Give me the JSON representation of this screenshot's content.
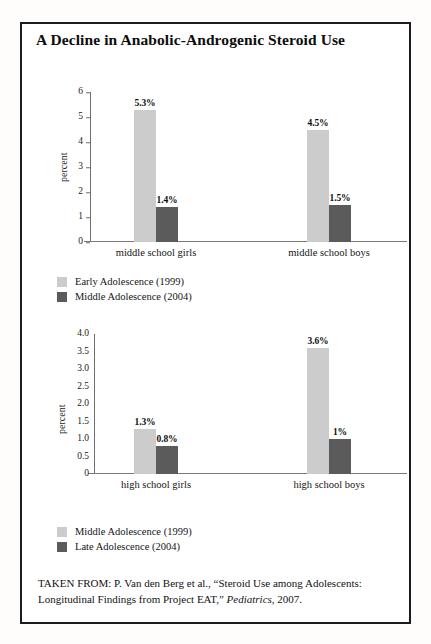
{
  "figure": {
    "title": "A Decline in Anabolic-Androgenic Steroid Use",
    "source_prefix": "TAKEN FROM: P. Van den Berg et al., “Steroid Use among Adolescents: Longitudinal Findings from Project EAT,” ",
    "source_italic": "Pediatrics",
    "source_suffix": ", 2007."
  },
  "colors": {
    "light_series": "#cccccc",
    "dark_series": "#5b5b5b",
    "frame": "#1c1c1c",
    "axis": "#6e6e6e"
  },
  "chart_data": [
    {
      "type": "bar",
      "id": "middle-school",
      "title": "",
      "xlabel": "",
      "ylabel": "percent",
      "ylim": [
        0,
        6
      ],
      "yticks": [
        "0",
        "1",
        "2",
        "3",
        "4",
        "5",
        "6"
      ],
      "ytick_values": [
        0,
        1,
        2,
        3,
        4,
        5,
        6
      ],
      "tickmarks": true,
      "grid": false,
      "categories": [
        "middle school girls",
        "middle school boys"
      ],
      "series": [
        {
          "name": "Early Adolescence (1999)",
          "color": "#cccccc",
          "values": [
            5.3,
            4.5
          ],
          "labels": [
            "5.3%",
            "4.5%"
          ]
        },
        {
          "name": "Middle Adolescence (2004)",
          "color": "#5b5b5b",
          "values": [
            1.4,
            1.5
          ],
          "labels": [
            "1.4%",
            "1.5%"
          ]
        }
      ],
      "legend": [
        {
          "label": "Early Adolescence (1999)",
          "swatch": "light"
        },
        {
          "label": "Middle Adolescence (2004)",
          "swatch": "dark"
        }
      ],
      "legend_position": "below-left"
    },
    {
      "type": "bar",
      "id": "high-school",
      "title": "",
      "xlabel": "",
      "ylabel": "percent",
      "ylim": [
        0,
        4.0
      ],
      "yticks": [
        "0",
        "0.5",
        "1.0",
        "1.5",
        "2.0",
        "2.5",
        "3.0",
        "3.5",
        "4.0"
      ],
      "ytick_values": [
        0,
        0.5,
        1.0,
        1.5,
        2.0,
        2.5,
        3.0,
        3.5,
        4.0
      ],
      "tickmarks": false,
      "grid": false,
      "categories": [
        "high school girls",
        "high school boys"
      ],
      "series": [
        {
          "name": "Middle Adolescence (1999)",
          "color": "#cccccc",
          "values": [
            1.3,
            3.6
          ],
          "labels": [
            "1.3%",
            "3.6%"
          ]
        },
        {
          "name": "Late Adolescence (2004)",
          "color": "#5b5b5b",
          "values": [
            0.8,
            1.0
          ],
          "labels": [
            "0.8%",
            "1%"
          ]
        }
      ],
      "legend": [
        {
          "label": "Middle Adolescence (1999)",
          "swatch": "light"
        },
        {
          "label": "Late Adolescence (2004)",
          "swatch": "dark"
        }
      ],
      "legend_position": "below-left"
    }
  ]
}
